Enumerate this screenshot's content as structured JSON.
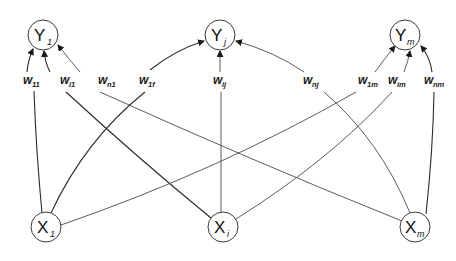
{
  "diagram": {
    "title": "",
    "type": "fully-connected bipartite network (inputs to outputs)",
    "colors": {
      "background": "#ffffff",
      "stroke": "#3a3a3a",
      "text": "#111111"
    },
    "output_nodes": [
      {
        "id": "Y1",
        "main": "Y",
        "sub": "1",
        "cx": 43,
        "cy": 35
      },
      {
        "id": "Yj",
        "main": "Y",
        "sub": "j",
        "cx": 220,
        "cy": 35
      },
      {
        "id": "Ym",
        "main": "Y",
        "sub": "m",
        "cx": 405,
        "cy": 35
      }
    ],
    "input_nodes": [
      {
        "id": "X1",
        "main": "X",
        "sub": "1",
        "cx": 46,
        "cy": 227
      },
      {
        "id": "Xi",
        "main": "X",
        "sub": "i",
        "cx": 223,
        "cy": 227
      },
      {
        "id": "Xm",
        "main": "X",
        "sub": "m",
        "cx": 415,
        "cy": 227
      }
    ],
    "weights": [
      {
        "id": "w11",
        "main": "w",
        "sub": "11",
        "from": "X1",
        "to": "Y1",
        "x": 34,
        "y": 84
      },
      {
        "id": "wi1",
        "main": "w",
        "sub": "i1",
        "from": "Xi",
        "to": "Y1",
        "x": 71,
        "y": 84
      },
      {
        "id": "wn1",
        "main": "w",
        "sub": "n1",
        "from": "Xm",
        "to": "Y1",
        "x": 110,
        "y": 84
      },
      {
        "id": "w1j",
        "main": "w",
        "sub": "1f",
        "from": "X1",
        "to": "Yj",
        "x": 150,
        "y": 84
      },
      {
        "id": "wij",
        "main": "w",
        "sub": "ij",
        "from": "Xi",
        "to": "Yj",
        "x": 221,
        "y": 84
      },
      {
        "id": "wnj",
        "main": "w",
        "sub": "nj",
        "from": "Xm",
        "to": "Yj",
        "x": 315,
        "y": 84
      },
      {
        "id": "w1m",
        "main": "w",
        "sub": "1m",
        "from": "X1",
        "to": "Ym",
        "x": 364,
        "y": 84
      },
      {
        "id": "wim",
        "main": "w",
        "sub": "im",
        "from": "Xi",
        "to": "Ym",
        "x": 396,
        "y": 84
      },
      {
        "id": "wnm",
        "main": "w",
        "sub": "nm",
        "from": "Xm",
        "to": "Ym",
        "x": 434,
        "y": 84
      }
    ]
  }
}
